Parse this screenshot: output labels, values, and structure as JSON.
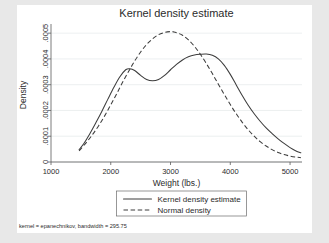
{
  "chart_data": {
    "type": "line",
    "title": "Kernel density estimate",
    "xlabel": "Weight (lbs.)",
    "ylabel": "Density",
    "xlim": [
      1000,
      5200
    ],
    "ylim": [
      0,
      0.00052
    ],
    "xticks": [
      1000,
      2000,
      3000,
      4000,
      5000
    ],
    "xtick_labels": [
      "1000",
      "2000",
      "3000",
      "4000",
      "5000"
    ],
    "yticks": [
      0,
      0.0001,
      0.0002,
      0.0003,
      0.0004,
      0.0005
    ],
    "ytick_labels": [
      "0",
      ".0001",
      ".0002",
      ".0003",
      ".0004",
      ".0005"
    ],
    "grid": "horizontal",
    "legend_position": "below",
    "note": "kernel = epanechnikov, bandwidth = 295.75",
    "series": [
      {
        "name": "Kernel density estimate",
        "style": "solid",
        "color": "#3c3c3c",
        "x": [
          1470,
          1550,
          1650,
          1750,
          1850,
          1950,
          2050,
          2150,
          2250,
          2320,
          2400,
          2500,
          2600,
          2700,
          2800,
          2900,
          3000,
          3100,
          3200,
          3300,
          3400,
          3500,
          3600,
          3700,
          3800,
          3900,
          4000,
          4100,
          4200,
          4300,
          4400,
          4500,
          4600,
          4700,
          4800,
          4900,
          5000,
          5100,
          5180
        ],
        "y": [
          4.8e-05,
          7.2e-05,
          0.00011,
          0.000152,
          0.000196,
          0.000243,
          0.000289,
          0.00033,
          0.000358,
          0.000362,
          0.000355,
          0.000336,
          0.00032,
          0.000315,
          0.00032,
          0.000336,
          0.000358,
          0.000379,
          0.000396,
          0.000408,
          0.000415,
          0.000418,
          0.000419,
          0.000414,
          0.0004,
          0.000375,
          0.00034,
          0.000299,
          0.000258,
          0.00022,
          0.000187,
          0.000158,
          0.000132,
          0.00011,
          9e-05,
          7.2e-05,
          5.6e-05,
          4.3e-05,
          3.6e-05
        ]
      },
      {
        "name": "Normal density",
        "style": "dashed",
        "color": "#3c3c3c",
        "x": [
          1470,
          1600,
          1700,
          1800,
          1900,
          2000,
          2100,
          2200,
          2300,
          2400,
          2500,
          2600,
          2700,
          2800,
          2900,
          3000,
          3050,
          3100,
          3200,
          3300,
          3400,
          3500,
          3600,
          3700,
          3800,
          3900,
          4000,
          4100,
          4200,
          4300,
          4400,
          4500,
          4600,
          4700,
          4800,
          4900,
          5000,
          5100,
          5180
        ],
        "y": [
          4.3e-05,
          7.8e-05,
          0.000108,
          0.000142,
          0.00018,
          0.000222,
          0.000265,
          0.00031,
          0.000352,
          0.000392,
          0.000427,
          0.000456,
          0.000478,
          0.000494,
          0.000503,
          0.000506,
          0.000505,
          0.000502,
          0.000492,
          0.000474,
          0.000449,
          0.000418,
          0.000382,
          0.000343,
          0.000302,
          0.000262,
          0.000223,
          0.000187,
          0.000154,
          0.000125,
          0.0001,
          7.9e-05,
          6.2e-05,
          4.8e-05,
          3.7e-05,
          2.9e-05,
          2.3e-05,
          1.9e-05,
          1.7e-05
        ]
      }
    ]
  },
  "legend": {
    "items": [
      {
        "label": "Kernel density estimate",
        "style": "solid"
      },
      {
        "label": "Normal density",
        "style": "dashed"
      }
    ]
  }
}
